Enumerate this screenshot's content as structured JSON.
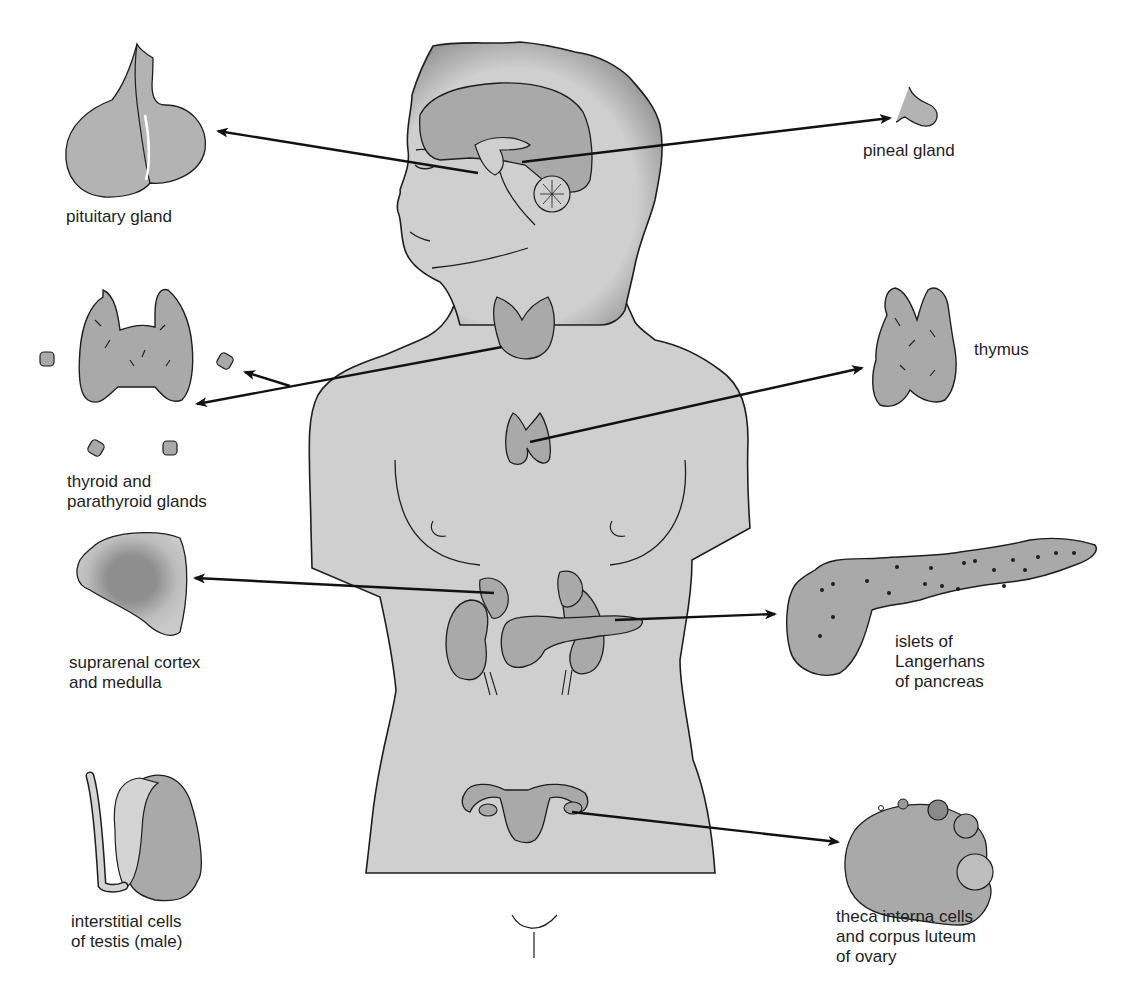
{
  "figure": {
    "colors": {
      "background": "#ffffff",
      "body_fill": "#cfcfcf",
      "gland_fill": "#a9a9a9",
      "outline": "#1e1e1e",
      "arrow": "#111111",
      "label_text": "#1e1e1e"
    }
  },
  "labels": {
    "pituitary": {
      "lines": [
        "pituitary gland"
      ]
    },
    "pineal": {
      "lines": [
        "pineal gland"
      ]
    },
    "thyroid": {
      "lines": [
        "thyroid and",
        "parathyroid glands"
      ]
    },
    "thymus": {
      "lines": [
        "thymus"
      ]
    },
    "suprarenal": {
      "lines": [
        "suprarenal cortex",
        "and medulla"
      ]
    },
    "pancreas": {
      "lines": [
        "islets of",
        "Langerhans",
        "of pancreas"
      ]
    },
    "testis": {
      "lines": [
        "interstitial cells",
        "of testis (male)"
      ]
    },
    "ovary": {
      "lines": [
        "theca interna cells",
        "and corpus luteum",
        "of ovary"
      ]
    }
  },
  "caption": {
    "text": ""
  }
}
